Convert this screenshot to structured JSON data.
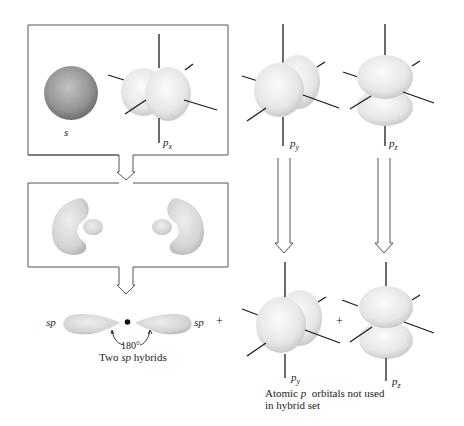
{
  "figure": {
    "colors": {
      "background": "#ffffff",
      "s_orbital": "#8f8f8f",
      "p_orbital": "#eeeeee",
      "hybrid_lobe": "#d8d8d8",
      "axis_line": "#1a1a1a",
      "box_border": "#555555"
    }
  },
  "box_atomic": {
    "s_label": "s",
    "px_label_main": "p",
    "px_label_sub": "x"
  },
  "top_right": {
    "py_label_main": "p",
    "py_label_sub": "y",
    "pz_label_main": "p",
    "pz_label_sub": "z"
  },
  "box_hybridization": {
    "description": "sp hybrid lobes forming (two pairs of large and small lobes)"
  },
  "hybrid_row": {
    "left_label": "sp",
    "right_label": "sp",
    "angle_label": "180°",
    "caption_pre": "Two ",
    "caption_em": "sp",
    "caption_post": " hybrids",
    "plus_1": "+",
    "plus_2": "+"
  },
  "bottom_right": {
    "py_label_main": "p",
    "py_label_sub": "y",
    "pz_label_main": "p",
    "pz_label_sub": "z",
    "caption_line1_pre": "Atomic ",
    "caption_line1_em": "p",
    "caption_line1_post": "  orbitals not used",
    "caption_line2": "in hybrid set"
  },
  "arrows": [
    {
      "name": "box1-to-box2"
    },
    {
      "name": "box2-to-hybrids"
    },
    {
      "name": "py-down"
    },
    {
      "name": "pz-down"
    }
  ]
}
